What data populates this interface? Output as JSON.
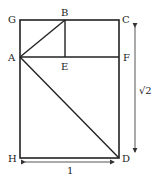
{
  "diagram": {
    "points": {
      "G": {
        "label": "G",
        "x": 20,
        "y": 20
      },
      "B": {
        "label": "B",
        "x": 65,
        "y": 20
      },
      "C": {
        "label": "C",
        "x": 119,
        "y": 20
      },
      "A": {
        "label": "A",
        "x": 20,
        "y": 57
      },
      "E": {
        "label": "E",
        "x": 65,
        "y": 57
      },
      "F": {
        "label": "F",
        "x": 119,
        "y": 57
      },
      "H": {
        "label": "H",
        "x": 20,
        "y": 158
      },
      "D": {
        "label": "D",
        "x": 119,
        "y": 158
      }
    },
    "dimensions": {
      "width_label": "1",
      "height_label": "√2"
    },
    "colors": {
      "stroke": "#222222",
      "arrow": "#555555"
    }
  }
}
